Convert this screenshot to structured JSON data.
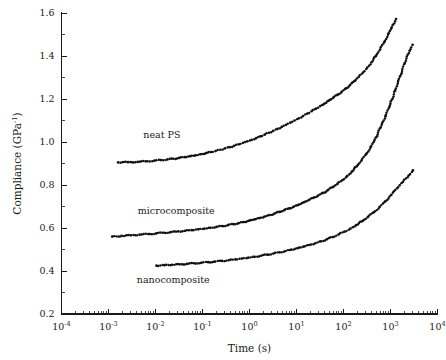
{
  "chart_data": {
    "type": "scatter",
    "title": "",
    "xlabel": "Time (s)",
    "ylabel": "Compliance (GPa",
    "ylabel_sup": "-1",
    "ylabel_tail": ")",
    "xscale": "log",
    "yscale": "linear",
    "xlim": [
      0.0001,
      10000
    ],
    "ylim": [
      0.2,
      1.6
    ],
    "grid": false,
    "legend_position": "inline-annotations",
    "x_tick_labels": [
      "10",
      "10",
      "10",
      "10",
      "10",
      "10",
      "10",
      "10",
      "10"
    ],
    "x_tick_exponents": [
      "-4",
      "-3",
      "-2",
      "-1",
      "0",
      "1",
      "2",
      "3",
      "4"
    ],
    "x_tick_values": [
      0.0001,
      0.001,
      0.01,
      0.1,
      1,
      10,
      100,
      1000,
      10000
    ],
    "y_tick_labels": [
      "0.2",
      "0.4",
      "0.6",
      "0.8",
      "1.0",
      "1.2",
      "1.4",
      "1.6"
    ],
    "y_tick_values": [
      0.2,
      0.4,
      0.6,
      0.8,
      1.0,
      1.2,
      1.4,
      1.6
    ],
    "marker_color": "#111111",
    "series": [
      {
        "name": "neat PS",
        "annotation": "neat PS",
        "annotation_x": 0.0055,
        "annotation_y": 1.02,
        "points": [
          [
            0.0016,
            0.905
          ],
          [
            0.0026,
            0.906
          ],
          [
            0.0042,
            0.908
          ],
          [
            0.0062,
            0.91
          ],
          [
            0.0095,
            0.913
          ],
          [
            0.013,
            0.916
          ],
          [
            0.018,
            0.919
          ],
          [
            0.024,
            0.922
          ],
          [
            0.032,
            0.926
          ],
          [
            0.042,
            0.93
          ],
          [
            0.055,
            0.934
          ],
          [
            0.071,
            0.938
          ],
          [
            0.092,
            0.943
          ],
          [
            0.118,
            0.948
          ],
          [
            0.15,
            0.953
          ],
          [
            0.19,
            0.958
          ],
          [
            0.24,
            0.964
          ],
          [
            0.3,
            0.97
          ],
          [
            0.38,
            0.976
          ],
          [
            0.47,
            0.982
          ],
          [
            0.59,
            0.989
          ],
          [
            0.73,
            0.996
          ],
          [
            0.9,
            1.003
          ],
          [
            1.12,
            1.01
          ],
          [
            1.38,
            1.018
          ],
          [
            1.7,
            1.026
          ],
          [
            2.1,
            1.034
          ],
          [
            2.6,
            1.043
          ],
          [
            3.2,
            1.052
          ],
          [
            3.95,
            1.061
          ],
          [
            4.85,
            1.07
          ],
          [
            6.0,
            1.08
          ],
          [
            7.4,
            1.09
          ],
          [
            9.1,
            1.1
          ],
          [
            11.2,
            1.11
          ],
          [
            13.8,
            1.121
          ],
          [
            17.0,
            1.132
          ],
          [
            21.0,
            1.143
          ],
          [
            26.0,
            1.155
          ],
          [
            32.0,
            1.167
          ],
          [
            39.5,
            1.179
          ],
          [
            48.5,
            1.192
          ],
          [
            60.0,
            1.205
          ],
          [
            74.0,
            1.219
          ],
          [
            91.0,
            1.233
          ],
          [
            112.0,
            1.249
          ],
          [
            138.0,
            1.265
          ],
          [
            170.0,
            1.283
          ],
          [
            210.0,
            1.302
          ],
          [
            260.0,
            1.323
          ],
          [
            320.0,
            1.346
          ],
          [
            395.0,
            1.371
          ],
          [
            485.0,
            1.399
          ],
          [
            600.0,
            1.43
          ],
          [
            740.0,
            1.465
          ],
          [
            910.0,
            1.505
          ],
          [
            1120.0,
            1.545
          ],
          [
            1310.0,
            1.572
          ]
        ]
      },
      {
        "name": "microcomposite",
        "annotation": "microcomposite",
        "annotation_x": 0.0042,
        "annotation_y": 0.665,
        "points": [
          [
            0.0012,
            0.56
          ],
          [
            0.0019,
            0.563
          ],
          [
            0.003,
            0.566
          ],
          [
            0.0046,
            0.569
          ],
          [
            0.007,
            0.572
          ],
          [
            0.0104,
            0.575
          ],
          [
            0.015,
            0.578
          ],
          [
            0.0215,
            0.581
          ],
          [
            0.0305,
            0.584
          ],
          [
            0.0425,
            0.587
          ],
          [
            0.059,
            0.59
          ],
          [
            0.081,
            0.594
          ],
          [
            0.11,
            0.597
          ],
          [
            0.148,
            0.601
          ],
          [
            0.198,
            0.605
          ],
          [
            0.262,
            0.609
          ],
          [
            0.345,
            0.613
          ],
          [
            0.452,
            0.618
          ],
          [
            0.59,
            0.623
          ],
          [
            0.765,
            0.628
          ],
          [
            0.99,
            0.634
          ],
          [
            1.27,
            0.64
          ],
          [
            1.63,
            0.646
          ],
          [
            2.09,
            0.653
          ],
          [
            2.67,
            0.66
          ],
          [
            3.4,
            0.667
          ],
          [
            4.33,
            0.675
          ],
          [
            5.5,
            0.683
          ],
          [
            6.98,
            0.691
          ],
          [
            8.85,
            0.7
          ],
          [
            11.2,
            0.709
          ],
          [
            14.2,
            0.719
          ],
          [
            18.0,
            0.729
          ],
          [
            22.8,
            0.74
          ],
          [
            28.9,
            0.751
          ],
          [
            36.6,
            0.763
          ],
          [
            46.3,
            0.776
          ],
          [
            58.6,
            0.79
          ],
          [
            74.2,
            0.805
          ],
          [
            94.0,
            0.822
          ],
          [
            119.0,
            0.841
          ],
          [
            150.0,
            0.862
          ],
          [
            190.0,
            0.886
          ],
          [
            241.0,
            0.913
          ],
          [
            305.0,
            0.944
          ],
          [
            386.0,
            0.98
          ],
          [
            489.0,
            1.021
          ],
          [
            619.0,
            1.068
          ],
          [
            784.0,
            1.12
          ],
          [
            993.0,
            1.178
          ],
          [
            1257.0,
            1.24
          ],
          [
            1592.0,
            1.305
          ],
          [
            2016.0,
            1.368
          ],
          [
            2553.0,
            1.424
          ],
          [
            2950.0,
            1.452
          ]
        ]
      },
      {
        "name": "nanocomposite",
        "annotation": "nanocomposite",
        "annotation_x": 0.004,
        "annotation_y": 0.345,
        "points": [
          [
            0.0105,
            0.425
          ],
          [
            0.0155,
            0.427
          ],
          [
            0.0225,
            0.429
          ],
          [
            0.0325,
            0.431
          ],
          [
            0.0465,
            0.433
          ],
          [
            0.066,
            0.436
          ],
          [
            0.094,
            0.438
          ],
          [
            0.132,
            0.441
          ],
          [
            0.186,
            0.444
          ],
          [
            0.26,
            0.447
          ],
          [
            0.362,
            0.45
          ],
          [
            0.5,
            0.454
          ],
          [
            0.69,
            0.458
          ],
          [
            0.945,
            0.462
          ],
          [
            1.29,
            0.466
          ],
          [
            1.76,
            0.471
          ],
          [
            2.38,
            0.476
          ],
          [
            3.22,
            0.481
          ],
          [
            4.34,
            0.487
          ],
          [
            5.83,
            0.493
          ],
          [
            7.82,
            0.499
          ],
          [
            10.5,
            0.506
          ],
          [
            14.0,
            0.513
          ],
          [
            18.7,
            0.521
          ],
          [
            25.0,
            0.529
          ],
          [
            33.4,
            0.538
          ],
          [
            44.5,
            0.548
          ],
          [
            59.3,
            0.558
          ],
          [
            79.0,
            0.57
          ],
          [
            105.0,
            0.583
          ],
          [
            140.0,
            0.597
          ],
          [
            186.0,
            0.613
          ],
          [
            248.0,
            0.631
          ],
          [
            330.0,
            0.651
          ],
          [
            440.0,
            0.673
          ],
          [
            586.0,
            0.698
          ],
          [
            780.0,
            0.725
          ],
          [
            1039.0,
            0.754
          ],
          [
            1383.0,
            0.785
          ],
          [
            1842.0,
            0.815
          ],
          [
            2452.0,
            0.845
          ],
          [
            3000.0,
            0.868
          ]
        ]
      }
    ]
  }
}
